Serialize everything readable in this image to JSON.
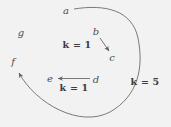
{
  "figure": {
    "background_color": "#f2f2f2",
    "stroke_color": "#6b6b6b",
    "label_color": "#4d4d4d",
    "weight_color": "#3c3c3c",
    "width": 171,
    "height": 127
  },
  "nodes": [
    {
      "id": "a",
      "label": "a",
      "x": 66,
      "y": 11
    },
    {
      "id": "b",
      "label": "b",
      "x": 96,
      "y": 32
    },
    {
      "id": "c",
      "label": "c",
      "x": 112,
      "y": 58
    },
    {
      "id": "d",
      "label": "d",
      "x": 96,
      "y": 80
    },
    {
      "id": "e",
      "label": "e",
      "x": 50,
      "y": 79
    },
    {
      "id": "f",
      "label": "f",
      "x": 13,
      "y": 62
    },
    {
      "id": "g",
      "label": "g",
      "x": 21,
      "y": 33
    }
  ],
  "edges": [
    {
      "id": "b-to-c",
      "from": "b",
      "to": "c",
      "weight_label": "k = 1",
      "weight_x": 77,
      "weight_y": 45,
      "path": "M 100 38 L 109 51"
    },
    {
      "id": "d-to-e",
      "from": "d",
      "to": "e",
      "weight_label": "k = 1",
      "weight_x": 74,
      "weight_y": 88,
      "path": "M 90 78.5 L 58 78.5"
    },
    {
      "id": "a-to-f",
      "from": "a",
      "to": "f",
      "weight_label": "k = 5",
      "weight_x": 145,
      "weight_y": 82,
      "path": "M 74 9 C 105 4 132 10 138 38 C 144 68 138 96 110 112 C 80 128 36 104 19 73"
    }
  ]
}
